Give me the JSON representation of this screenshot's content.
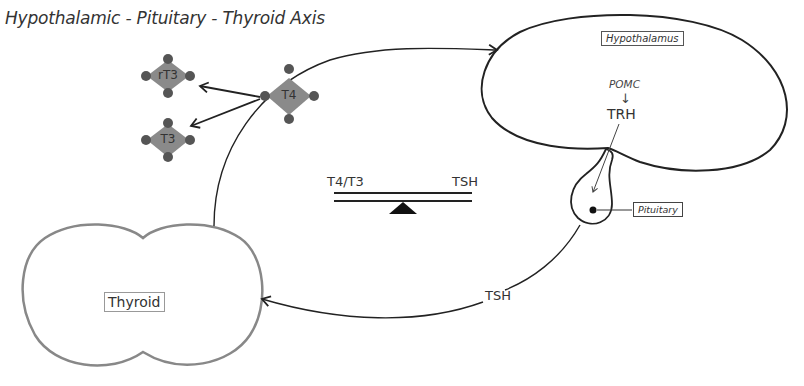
{
  "title": "Hypothalamic - Pituitary - Thyroid Axis",
  "organs": {
    "hypothalamus": {
      "label": "Hypothalamus"
    },
    "pituitary": {
      "label": "Pituitary"
    },
    "thyroid": {
      "label": "Thyroid"
    }
  },
  "hormones": {
    "pomc": "POMC",
    "pomc_arrow": "↓",
    "trh": "TRH",
    "tsh": "TSH"
  },
  "molecules": {
    "t4": "T4",
    "rt3": "rT3",
    "t3": "T3"
  },
  "balance": {
    "left": "T4/T3",
    "right": "TSH"
  },
  "colors": {
    "molecule_fill": "#8a8a8a",
    "molecule_dot": "#555555",
    "line": "#222222",
    "thyroid_outline": "#888888"
  }
}
